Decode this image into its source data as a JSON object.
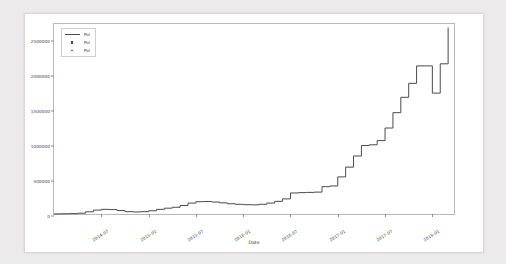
{
  "chart_data": {
    "type": "line",
    "title": "",
    "xlabel": "Date",
    "ylabel": "",
    "grid": false,
    "legend_position": "upper-left",
    "ylim": [
      0,
      2750000
    ],
    "yticks": [
      0,
      500000,
      1000000,
      1500000,
      2000000,
      2500000
    ],
    "ytick_labels": [
      "0",
      "500000",
      "1000000",
      "1500000",
      "2000000",
      "2500000"
    ],
    "xticks": [
      "2014-07",
      "2015-01",
      "2015-07",
      "2016-01",
      "2016-07",
      "2017-01",
      "2017-07",
      "2018-01"
    ],
    "xlim": [
      "2014-01",
      "2018-04"
    ],
    "legend": [
      {
        "label": "Pol",
        "marker": "line"
      },
      {
        "label": "Pol",
        "marker": "point"
      },
      {
        "label": "Pol",
        "marker": "triangle"
      }
    ],
    "series": [
      {
        "name": "Pol",
        "color": "#4a4a4a",
        "x": [
          "2014-01",
          "2014-02",
          "2014-03",
          "2014-04",
          "2014-05",
          "2014-06",
          "2014-07",
          "2014-08",
          "2014-09",
          "2014-10",
          "2014-11",
          "2014-12",
          "2015-01",
          "2015-02",
          "2015-03",
          "2015-04",
          "2015-05",
          "2015-06",
          "2015-07",
          "2015-08",
          "2015-09",
          "2015-10",
          "2015-11",
          "2015-12",
          "2016-01",
          "2016-02",
          "2016-03",
          "2016-04",
          "2016-05",
          "2016-06",
          "2016-07",
          "2016-08",
          "2016-09",
          "2016-10",
          "2016-11",
          "2016-12",
          "2017-01",
          "2017-02",
          "2017-03",
          "2017-04",
          "2017-05",
          "2017-06",
          "2017-07",
          "2017-08",
          "2017-09",
          "2017-10",
          "2017-11",
          "2017-12",
          "2018-01",
          "2018-02",
          "2018-03"
        ],
        "values": [
          30000,
          32000,
          34000,
          40000,
          60000,
          85000,
          95000,
          92000,
          78000,
          62000,
          58000,
          62000,
          75000,
          95000,
          112000,
          125000,
          150000,
          185000,
          205000,
          208000,
          200000,
          188000,
          175000,
          168000,
          162000,
          160000,
          168000,
          185000,
          210000,
          245000,
          330000,
          335000,
          338000,
          342000,
          420000,
          430000,
          560000,
          700000,
          860000,
          1010000,
          1020000,
          1080000,
          1260000,
          1480000,
          1700000,
          1900000,
          2150000,
          2150000,
          1760000,
          2180000,
          2700000
        ]
      }
    ]
  }
}
